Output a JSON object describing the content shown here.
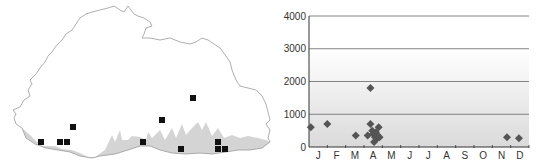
{
  "map": {
    "title": "Distribution map",
    "outline_color": "#9a9a9a",
    "lowland_color": "#d4d4d4",
    "marker_color": "#111111",
    "markers": [
      {
        "x": 41,
        "y": 142
      },
      {
        "x": 60,
        "y": 142
      },
      {
        "x": 67,
        "y": 142
      },
      {
        "x": 73,
        "y": 127
      },
      {
        "x": 143,
        "y": 142
      },
      {
        "x": 162,
        "y": 120
      },
      {
        "x": 181,
        "y": 149
      },
      {
        "x": 193,
        "y": 98
      },
      {
        "x": 218,
        "y": 142
      },
      {
        "x": 218,
        "y": 149
      },
      {
        "x": 225,
        "y": 149
      }
    ]
  },
  "chart_data": {
    "type": "scatter",
    "title": "",
    "xlabel": "",
    "ylabel": "",
    "ylim": [
      0,
      4000
    ],
    "yticks": [
      0,
      1000,
      2000,
      3000,
      4000
    ],
    "ytick_labels": [
      "0",
      "1000",
      "2000",
      "3000",
      "4000"
    ],
    "xticks": [
      "J",
      "F",
      "M",
      "A",
      "M",
      "J",
      "J",
      "A",
      "S",
      "O",
      "N",
      "D"
    ],
    "grid": true,
    "legend": null,
    "marker": "diamond",
    "marker_color": "#555555",
    "background_gradient": [
      "#ffffff",
      "#dcdcdc"
    ],
    "points": [
      {
        "month": 0.1,
        "value": 600
      },
      {
        "month": 1.0,
        "value": 700
      },
      {
        "month": 2.55,
        "value": 350
      },
      {
        "month": 3.2,
        "value": 350
      },
      {
        "month": 3.35,
        "value": 1800
      },
      {
        "month": 3.35,
        "value": 700
      },
      {
        "month": 3.45,
        "value": 500
      },
      {
        "month": 3.5,
        "value": 400
      },
      {
        "month": 3.55,
        "value": 150
      },
      {
        "month": 3.6,
        "value": 300
      },
      {
        "month": 3.65,
        "value": 450
      },
      {
        "month": 3.7,
        "value": 250
      },
      {
        "month": 3.75,
        "value": 350
      },
      {
        "month": 3.8,
        "value": 600
      },
      {
        "month": 3.85,
        "value": 300
      },
      {
        "month": 10.8,
        "value": 300
      },
      {
        "month": 11.45,
        "value": 270
      }
    ]
  }
}
